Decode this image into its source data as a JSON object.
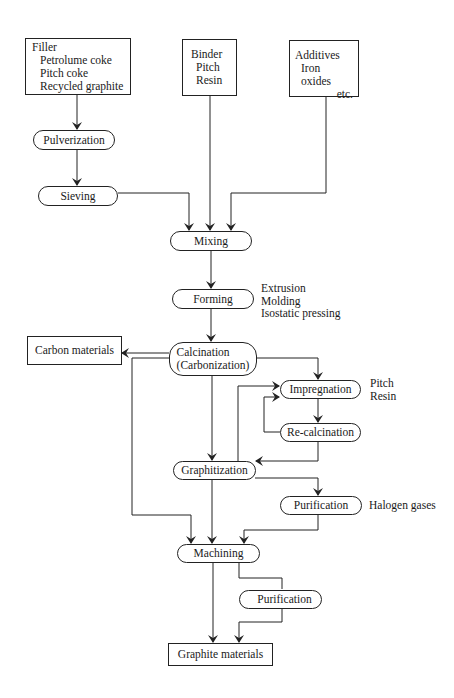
{
  "diagram": {
    "nodes": {
      "filler": {
        "title": "Filler",
        "items": [
          "Petrolume coke",
          "Pitch coke",
          "Recycled graphite"
        ]
      },
      "binder": {
        "title": "Binder",
        "items": [
          "Pitch",
          "Resin"
        ]
      },
      "additives": {
        "title": "Additives",
        "items": [
          "Iron oxides",
          "etc."
        ]
      },
      "pulverization": {
        "label": "Pulverization"
      },
      "sieving": {
        "label": "Sieving"
      },
      "mixing": {
        "label": "Mixing"
      },
      "forming": {
        "label": "Forming"
      },
      "calcination": {
        "line1": "Calcination",
        "line2": "(Carbonization)"
      },
      "carbon_materials": {
        "label": "Carbon materials"
      },
      "impregnation": {
        "label": "Impregnation"
      },
      "recalcination": {
        "label": "Re-calcination"
      },
      "graphitization": {
        "label": "Graphitization"
      },
      "purification_1": {
        "label": "Purification"
      },
      "machining": {
        "label": "Machining"
      },
      "purification_2": {
        "label": "Purification"
      },
      "graphite_materials": {
        "label": "Graphite materials"
      }
    },
    "notes": {
      "forming_methods": [
        "Extrusion",
        "Molding",
        "Isostatic pressing"
      ],
      "impregnants": [
        "Pitch",
        "Resin"
      ],
      "purification_agent": "Halogen gases"
    },
    "edges": [
      [
        "filler",
        "pulverization"
      ],
      [
        "pulverization",
        "sieving"
      ],
      [
        "sieving",
        "mixing"
      ],
      [
        "binder",
        "mixing"
      ],
      [
        "additives",
        "mixing"
      ],
      [
        "mixing",
        "forming"
      ],
      [
        "forming",
        "calcination"
      ],
      [
        "calcination",
        "carbon_materials"
      ],
      [
        "calcination",
        "impregnation"
      ],
      [
        "calcination",
        "graphitization"
      ],
      [
        "calcination",
        "machining"
      ],
      [
        "impregnation",
        "recalcination"
      ],
      [
        "recalcination",
        "impregnation"
      ],
      [
        "recalcination",
        "graphitization"
      ],
      [
        "graphitization",
        "impregnation"
      ],
      [
        "graphitization",
        "purification_1"
      ],
      [
        "graphitization",
        "machining"
      ],
      [
        "purification_1",
        "machining"
      ],
      [
        "machining",
        "purification_2"
      ],
      [
        "machining",
        "graphite_materials"
      ],
      [
        "purification_2",
        "graphite_materials"
      ]
    ],
    "colors": {
      "line": "#222222",
      "background": "#ffffff",
      "text": "#1a1a1a"
    }
  }
}
